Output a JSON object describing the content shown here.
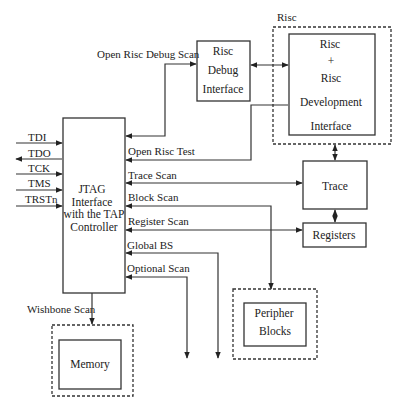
{
  "diagram": {
    "groups": {
      "risc_group_label": "Risc"
    },
    "blocks": {
      "jtag": [
        "JTAG",
        "Interface",
        "with the TAP",
        "Controller"
      ],
      "risc_debug": [
        "Risc",
        "Debug",
        "Interface"
      ],
      "risc_dev": [
        "Risc",
        "+",
        "Risc",
        "Development",
        "Interface"
      ],
      "trace": "Trace",
      "registers": "Registers",
      "peripher": [
        "Peripher",
        "Blocks"
      ],
      "memory": "Memory"
    },
    "signals": {
      "tdi": "TDI",
      "tdo": "TDO",
      "tck": "TCK",
      "tms": "TMS",
      "trstn": "TRSTn"
    },
    "scan_chains": {
      "open_risc_debug_scan": "Open Risc Debug Scan",
      "open_risc_test": "Open Risc Test",
      "trace_scan": "Trace Scan",
      "block_scan": "Block Scan",
      "register_scan": "Register Scan",
      "global_bs": "Global BS",
      "optional_scan": "Optional Scan",
      "wishbone_scan": "Wishbone Scan"
    }
  }
}
